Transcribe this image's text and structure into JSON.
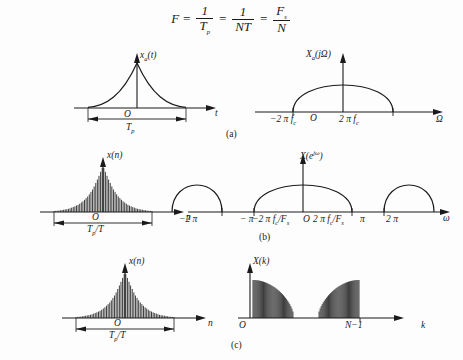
{
  "figure": {
    "equation": {
      "lhs": "F",
      "eq1": "=",
      "t1_num": "1",
      "t1_den": "T",
      "t1_den_sub": "p",
      "eq2": "=",
      "t2_num": "1",
      "t2_den": "NT",
      "eq3": "=",
      "t3_num": "F",
      "t3_num_sub": "s",
      "t3_den": "N"
    },
    "captions": {
      "a": "(a)",
      "b": "(b)",
      "c": "(c)"
    },
    "panels": {
      "a_time": {
        "signal_label": "x",
        "signal_sub": "a",
        "signal_arg": "(t)",
        "origin": "O",
        "xaxis": "t",
        "span_label": "T",
        "span_sub": "p"
      },
      "a_freq": {
        "signal_label": "X",
        "signal_sub": "a",
        "signal_arg": "(jΩ)",
        "origin": "O",
        "xaxis": "Ω",
        "tick_left": "−2 π f",
        "tick_left_sub": "c",
        "tick_right": "2 π f",
        "tick_right_sub": "c"
      },
      "b_time": {
        "signal_label": "x(n)",
        "origin": "O",
        "xaxis": "n",
        "span_label": "T",
        "span_sub": "p",
        "span_tail": "/T"
      },
      "b_freq": {
        "signal_label": "X(e",
        "signal_sup": "jω",
        "signal_tail": ")",
        "origin": "O",
        "xaxis": "ω",
        "tick_m2pi": "−2 π",
        "tick_mpi": "− π",
        "tick_mfc": "−2 π f",
        "tick_mfc_sub": "c",
        "tick_mfc_tail": "/F",
        "tick_mfc_sub2": "s",
        "tick_pfc": "2 π f",
        "tick_pfc_sub": "c",
        "tick_pfc_tail": "/F",
        "tick_pfc_sub2": "s",
        "tick_pi": "π",
        "tick_2pi": "2 π"
      },
      "c_time": {
        "signal_label": "x(n)",
        "origin": "O",
        "xaxis": "n",
        "span_label": "T",
        "span_sub": "p",
        "span_tail": "/T"
      },
      "c_freq": {
        "signal_label": "X(k)",
        "origin": "O",
        "xaxis": "k",
        "tick_end": "N−1"
      }
    }
  },
  "chart_data": [
    {
      "type": "line",
      "id": "a_time",
      "title": "x_a(t)",
      "xlabel": "t",
      "ylabel": "",
      "description": "Two-sided exponential decay pulse centered at origin, effective duration T_p",
      "x": [
        -1.0,
        -0.9,
        -0.8,
        -0.7,
        -0.6,
        -0.5,
        -0.4,
        -0.3,
        -0.2,
        -0.1,
        0,
        0.1,
        0.2,
        0.3,
        0.4,
        0.5,
        0.6,
        0.7,
        0.8,
        0.9,
        1.0
      ],
      "y": [
        0.02,
        0.03,
        0.05,
        0.07,
        0.11,
        0.16,
        0.24,
        0.35,
        0.51,
        0.74,
        1.0,
        0.74,
        0.51,
        0.35,
        0.24,
        0.16,
        0.11,
        0.07,
        0.05,
        0.03,
        0.02
      ],
      "grid": false
    },
    {
      "type": "line",
      "id": "a_freq",
      "title": "X_a(jΩ)",
      "xlabel": "Ω",
      "ylabel": "",
      "description": "Single band-limited dome spanning -2πf_c to 2πf_c",
      "xticks": [
        "−2πf_c",
        "O",
        "2πf_c"
      ],
      "x": [
        -1,
        -0.9,
        -0.75,
        -0.6,
        -0.4,
        -0.2,
        0,
        0.2,
        0.4,
        0.6,
        0.75,
        0.9,
        1
      ],
      "y": [
        0,
        0.44,
        0.66,
        0.8,
        0.92,
        0.98,
        1.0,
        0.98,
        0.92,
        0.8,
        0.66,
        0.44,
        0
      ],
      "grid": false
    },
    {
      "type": "bar",
      "id": "b_time",
      "title": "x(n)",
      "xlabel": "n",
      "ylabel": "",
      "description": "Sampled exponential decay stem sequence, duration T_p/T",
      "x": [
        -1.0,
        -0.9,
        -0.8,
        -0.7,
        -0.6,
        -0.5,
        -0.4,
        -0.3,
        -0.2,
        -0.1,
        0,
        0.1,
        0.2,
        0.3,
        0.4,
        0.5,
        0.6,
        0.7,
        0.8,
        0.9,
        1.0
      ],
      "values": [
        0.02,
        0.03,
        0.05,
        0.07,
        0.11,
        0.16,
        0.24,
        0.35,
        0.51,
        0.74,
        1.0,
        0.74,
        0.51,
        0.35,
        0.24,
        0.16,
        0.11,
        0.07,
        0.05,
        0.03,
        0.02
      ],
      "grid": false
    },
    {
      "type": "line",
      "id": "b_freq",
      "title": "X(e^{jω})",
      "xlabel": "ω",
      "ylabel": "",
      "description": "Periodic replicas of the dome spectrum repeating every 2π",
      "xticks": [
        "−2π",
        "−π",
        "−2πf_c/F_s",
        "O",
        "2πf_c/F_s",
        "π",
        "2π"
      ],
      "replica_centers": [
        -2.0,
        0,
        2.0
      ],
      "replica_halfwidth": 0.62,
      "grid": false
    },
    {
      "type": "bar",
      "id": "c_time",
      "title": "x(n)",
      "xlabel": "n",
      "ylabel": "",
      "description": "Sampled exponential decay stem sequence, duration T_p/T",
      "x": [
        -1.0,
        -0.9,
        -0.8,
        -0.7,
        -0.6,
        -0.5,
        -0.4,
        -0.3,
        -0.2,
        -0.1,
        0,
        0.1,
        0.2,
        0.3,
        0.4,
        0.5,
        0.6,
        0.7,
        0.8,
        0.9,
        1.0
      ],
      "values": [
        0.02,
        0.03,
        0.05,
        0.07,
        0.11,
        0.16,
        0.24,
        0.35,
        0.51,
        0.74,
        1.0,
        0.74,
        0.51,
        0.35,
        0.24,
        0.16,
        0.11,
        0.07,
        0.05,
        0.03,
        0.02
      ],
      "grid": false
    },
    {
      "type": "bar",
      "id": "c_freq",
      "title": "X(k)",
      "xlabel": "k",
      "ylabel": "",
      "description": "DFT magnitude: two symmetric lobes, one at k=0 and mirror near k=N-1",
      "xticks": [
        "O",
        "N−1"
      ],
      "n_points": 40,
      "grid": false
    }
  ]
}
